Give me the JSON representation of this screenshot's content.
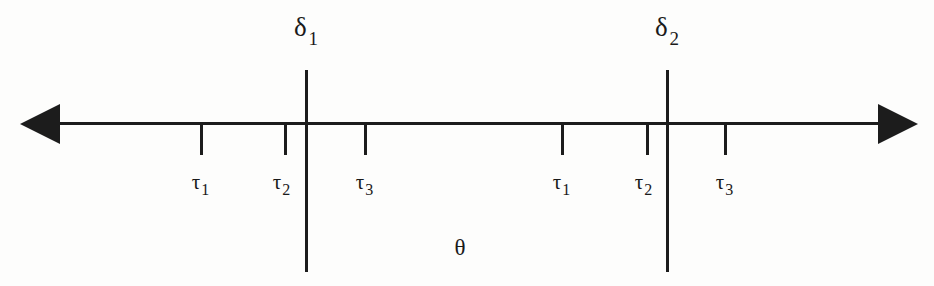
{
  "figure": {
    "width": 934,
    "height": 286,
    "background_color": "#fdfdfc",
    "ink_color": "#1c1c1c",
    "axis_label": "θ",
    "axis_label_x": 460,
    "axis": {
      "y": 122,
      "left_end_x": 40,
      "right_end_x": 900,
      "left_arrow": "left-arrowhead",
      "right_arrow": "right-arrowhead"
    }
  },
  "thresholds": [
    {
      "id": "delta-1",
      "symbol": "δ",
      "subscript": "1",
      "x": 305
    },
    {
      "id": "delta-2",
      "symbol": "δ",
      "subscript": "2",
      "x": 666
    }
  ],
  "tick_groups": [
    {
      "id": "group-1",
      "ticks": [
        {
          "id": "tau-1-a",
          "symbol": "τ",
          "subscript": "1",
          "x": 200,
          "label_x": 200
        },
        {
          "id": "tau-2-a",
          "symbol": "τ",
          "subscript": "2",
          "x": 284,
          "label_x": 281
        },
        {
          "id": "tau-3-a",
          "symbol": "τ",
          "subscript": "3",
          "x": 364,
          "label_x": 364
        }
      ]
    },
    {
      "id": "group-2",
      "ticks": [
        {
          "id": "tau-1-b",
          "symbol": "τ",
          "subscript": "1",
          "x": 561,
          "label_x": 561
        },
        {
          "id": "tau-2-b",
          "symbol": "τ",
          "subscript": "2",
          "x": 646,
          "label_x": 643
        },
        {
          "id": "tau-3-b",
          "symbol": "τ",
          "subscript": "3",
          "x": 724,
          "label_x": 724
        }
      ]
    }
  ]
}
